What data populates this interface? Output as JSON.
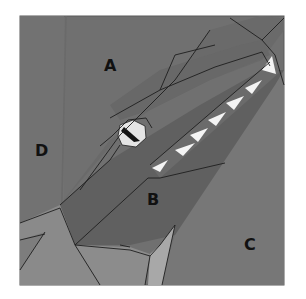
{
  "diagram": {
    "section_labels": [
      "A",
      "B",
      "C",
      "D"
    ],
    "colors": {
      "background_dark": "#6f6f6f",
      "background_mid": "#7a7a7a",
      "head": "#676767",
      "jaw": "#5f5f5f",
      "light_piece": "#8e8e8e",
      "lighter_piece": "#a6a6a6",
      "tooth": "#f4f4f4",
      "eye_white": "#e6e6e6",
      "pupil": "#141414",
      "border": "#585858"
    }
  }
}
